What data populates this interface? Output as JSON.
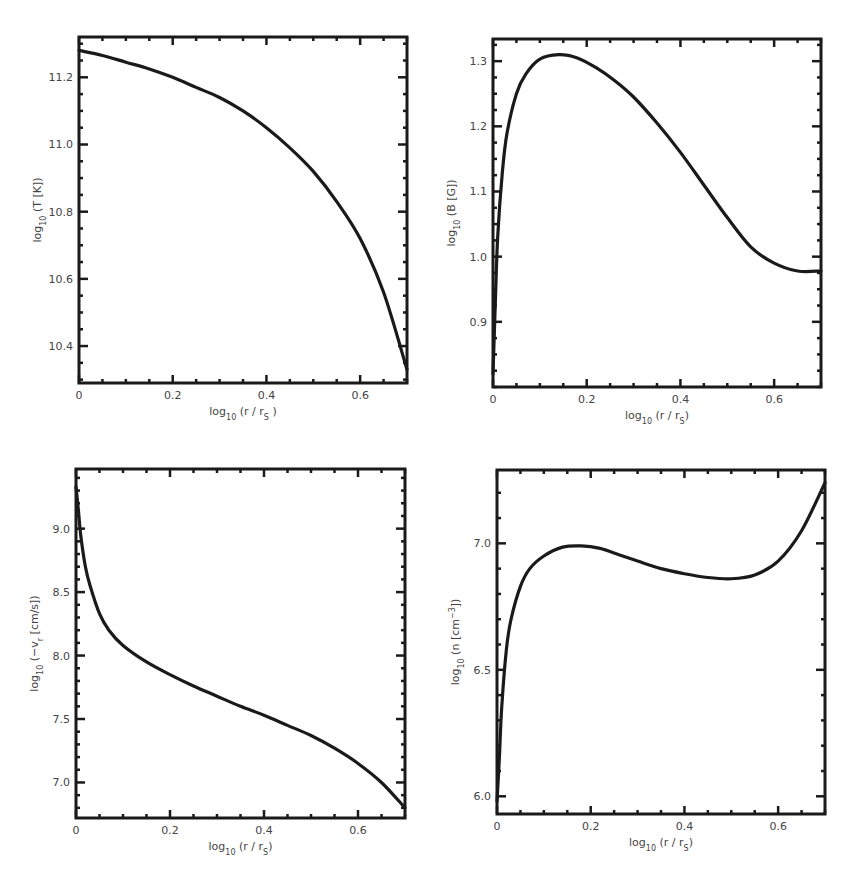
{
  "figure": {
    "panels": [
      {
        "id": "temperature",
        "ylabel_main": "log",
        "ylabel_sub": "10",
        "ylabel_rest": " (T [K])",
        "xlabel_main": "log",
        "xlabel_sub": "10",
        "xlabel_rest": " (r / r",
        "xlabel_sub2": "S",
        "xlabel_end": " )"
      },
      {
        "id": "magnetic-field",
        "ylabel_main": "log",
        "ylabel_sub": "10",
        "ylabel_rest": " (B [G])",
        "xlabel_main": "log",
        "xlabel_sub": "10",
        "xlabel_rest": " (r / r",
        "xlabel_sub2": "S",
        "xlabel_end": ")"
      },
      {
        "id": "radial-velocity",
        "ylabel_main": "log",
        "ylabel_sub": "10",
        "ylabel_rest": " (−v",
        "ylabel_sub2": "r",
        "ylabel_end": " [cm/s])",
        "xlabel_main": "log",
        "xlabel_sub": "10",
        "xlabel_rest": " (r / r",
        "xlabel_sub2": "S",
        "xlabel_end": ")"
      },
      {
        "id": "number-density",
        "ylabel_main": "log",
        "ylabel_sub": "10",
        "ylabel_rest": " (n [cm",
        "ylabel_sup": "−3",
        "ylabel_end": "])",
        "xlabel_main": "log",
        "xlabel_sub": "10",
        "xlabel_rest": " (r / r",
        "xlabel_sub2": "S",
        "xlabel_end": ")"
      }
    ]
  },
  "chart_data": [
    {
      "type": "line",
      "title": "",
      "xlabel": "log10 (r / rS)",
      "ylabel": "log10 (T [K])",
      "xlim": [
        0,
        0.7
      ],
      "ylim": [
        10.29,
        11.32
      ],
      "x_ticks": [
        "0",
        "0.2",
        "0.4",
        "0.6"
      ],
      "y_ticks": [
        "10.4",
        "10.6",
        "10.8",
        "11.0",
        "11.2"
      ],
      "grid": false,
      "series": [
        {
          "name": "T",
          "x": [
            0.0,
            0.05,
            0.1,
            0.15,
            0.2,
            0.25,
            0.3,
            0.35,
            0.4,
            0.45,
            0.5,
            0.55,
            0.6,
            0.65,
            0.7
          ],
          "y": [
            11.28,
            11.265,
            11.245,
            11.225,
            11.2,
            11.17,
            11.14,
            11.1,
            11.05,
            10.99,
            10.92,
            10.83,
            10.72,
            10.56,
            10.33
          ]
        }
      ]
    },
    {
      "type": "line",
      "title": "",
      "xlabel": "log10 (r / rS)",
      "ylabel": "log10 (B [G])",
      "xlim": [
        0,
        0.7
      ],
      "ylim": [
        0.8,
        1.334
      ],
      "x_ticks": [
        "0",
        "0.2",
        "0.4",
        "0.6"
      ],
      "y_ticks": [
        "0.9",
        "1.0",
        "1.1",
        "1.2",
        "1.3"
      ],
      "grid": false,
      "series": [
        {
          "name": "B",
          "x": [
            0.0,
            0.005,
            0.01,
            0.02,
            0.03,
            0.05,
            0.07,
            0.1,
            0.14,
            0.18,
            0.22,
            0.26,
            0.3,
            0.35,
            0.4,
            0.45,
            0.5,
            0.55,
            0.6,
            0.65,
            0.7
          ],
          "y": [
            0.82,
            0.93,
            1.03,
            1.13,
            1.19,
            1.25,
            1.28,
            1.303,
            1.31,
            1.305,
            1.29,
            1.27,
            1.245,
            1.205,
            1.16,
            1.11,
            1.06,
            1.015,
            0.99,
            0.978,
            0.978
          ]
        }
      ]
    },
    {
      "type": "line",
      "title": "",
      "xlabel": "log10 (r / rS)",
      "ylabel": "log10 (−vr [cm/s])",
      "xlim": [
        0,
        0.7
      ],
      "ylim": [
        6.72,
        9.47
      ],
      "x_ticks": [
        "0",
        "0.2",
        "0.4",
        "0.6"
      ],
      "y_ticks": [
        "7.0",
        "7.5",
        "8.0",
        "8.5",
        "9.0"
      ],
      "grid": false,
      "series": [
        {
          "name": "-vr",
          "x": [
            0.0,
            0.005,
            0.01,
            0.02,
            0.03,
            0.05,
            0.07,
            0.1,
            0.15,
            0.2,
            0.25,
            0.3,
            0.35,
            0.4,
            0.45,
            0.5,
            0.55,
            0.6,
            0.65,
            0.7
          ],
          "y": [
            9.33,
            9.15,
            8.95,
            8.7,
            8.55,
            8.33,
            8.2,
            8.08,
            7.95,
            7.85,
            7.76,
            7.68,
            7.6,
            7.53,
            7.45,
            7.37,
            7.27,
            7.15,
            7.0,
            6.8
          ]
        }
      ]
    },
    {
      "type": "line",
      "title": "",
      "xlabel": "log10 (r / rS)",
      "ylabel": "log10 (n [cm−3])",
      "xlim": [
        0,
        0.7
      ],
      "ylim": [
        5.93,
        7.29
      ],
      "x_ticks": [
        "0",
        "0.2",
        "0.4",
        "0.6"
      ],
      "y_ticks": [
        "6.0",
        "6.5",
        "7.0"
      ],
      "grid": false,
      "series": [
        {
          "name": "n",
          "x": [
            0.0,
            0.005,
            0.01,
            0.02,
            0.03,
            0.05,
            0.07,
            0.1,
            0.14,
            0.18,
            0.22,
            0.26,
            0.3,
            0.35,
            0.4,
            0.45,
            0.5,
            0.55,
            0.6,
            0.65,
            0.7
          ],
          "y": [
            5.98,
            6.15,
            6.35,
            6.58,
            6.7,
            6.83,
            6.9,
            6.95,
            6.985,
            6.99,
            6.98,
            6.955,
            6.93,
            6.9,
            6.88,
            6.865,
            6.86,
            6.875,
            6.93,
            7.05,
            7.24
          ]
        }
      ]
    }
  ]
}
